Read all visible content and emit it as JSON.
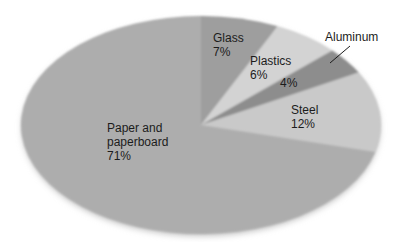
{
  "background_color": "#ffffff",
  "text_color": "#1c1c1c",
  "chart_data": {
    "type": "pie",
    "title": "",
    "unit": "%",
    "clockwise": true,
    "start_angle_deg_from_top": 0,
    "categories": [
      "Glass",
      "Plastics",
      "Aluminum",
      "Steel",
      "Paper and paperboard"
    ],
    "values": [
      7,
      6,
      4,
      12,
      71
    ],
    "slices": [
      {
        "id": "glass",
        "name": "Glass",
        "value": 7,
        "color": "#9e9e9e",
        "label": {
          "x": 213,
          "y": 42,
          "line_height": 14,
          "lines": [
            "Glass",
            "7%"
          ]
        }
      },
      {
        "id": "plastics",
        "name": "Plastics",
        "value": 6,
        "color": "#d3d3d3",
        "label": {
          "x": 250,
          "y": 65,
          "line_height": 14,
          "lines": [
            "Plastics",
            "6%"
          ]
        }
      },
      {
        "id": "aluminum",
        "name": "Aluminum",
        "value": 4,
        "color": "#8d8d8d",
        "label": {
          "x": 280,
          "y": 87,
          "line_height": 14,
          "lines": [
            "4%"
          ]
        },
        "callout": {
          "text": "Aluminum",
          "x": 325,
          "y": 41,
          "leader_line": {
            "x1": 350,
            "y1": 46,
            "x2": 330,
            "y2": 63
          }
        }
      },
      {
        "id": "steel",
        "name": "Steel",
        "value": 12,
        "color": "#c9c9c9",
        "label": {
          "x": 291,
          "y": 114,
          "line_height": 14,
          "lines": [
            "Steel",
            "12%"
          ]
        }
      },
      {
        "id": "paper",
        "name": "Paper and paperboard",
        "value": 71,
        "color": "#adadad",
        "label": {
          "x": 107,
          "y": 132,
          "line_height": 14,
          "lines": [
            "Paper and",
            "paperboard",
            "71%"
          ]
        }
      }
    ],
    "layout_hints": {
      "canvas_width": 393,
      "canvas_height": 242,
      "center_x": 201,
      "center_y": 125,
      "radius_x": 180,
      "radius_y": 109,
      "legend": "none",
      "labels_inside": true,
      "soft_shaded_edges": true
    }
  }
}
